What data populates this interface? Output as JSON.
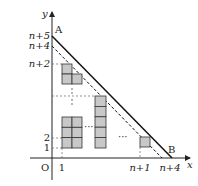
{
  "diagram": {
    "axes": {
      "x_label": "x",
      "y_label": "y",
      "origin_label": "O"
    },
    "points": {
      "A": {
        "label": "A"
      },
      "B": {
        "label": "B"
      }
    },
    "y_ticks": [
      {
        "label": "n+5"
      },
      {
        "label": "n+4"
      },
      {
        "label": "n+2"
      },
      {
        "label": "2"
      },
      {
        "label": "1"
      }
    ],
    "x_ticks": [
      {
        "label": "1"
      },
      {
        "label": "n+1"
      },
      {
        "label": "n+4"
      }
    ],
    "ellipsis": "···",
    "colors": {
      "cell_fill": "#c8c8c8",
      "cell_stroke": "#333333",
      "line": "#111111"
    }
  }
}
